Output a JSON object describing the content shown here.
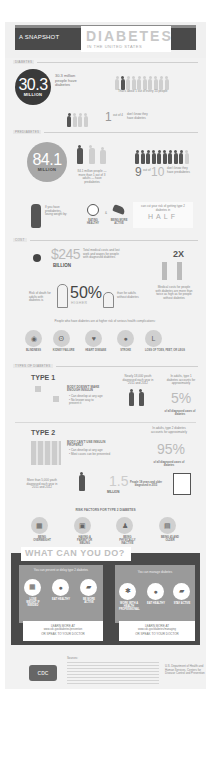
{
  "header": {
    "kicker": "A SNAPSHOT",
    "title": "DIABETES",
    "subtitle": "IN THE UNITED STATES"
  },
  "diabetes": {
    "section_label": "DIABETES",
    "big_number": "30.3",
    "big_unit": "MILLION",
    "stat_text": "30.3 million people have diabetes",
    "people_caption": "That's about 1 out of every 10 people",
    "unaware_number": "1",
    "unaware_ratio": "out of 4",
    "unaware_text": "don't know they have diabetes"
  },
  "prediabetes": {
    "section_label": "PREDIABETES",
    "big_number": "84.1",
    "big_unit": "MILLION",
    "stat_text": "84.1 million people — more than 1 out of 3 adults — have prediabetes",
    "ratio_big": "9",
    "ratio_of": "out of",
    "ratio_total": "10",
    "ratio_text": "don't know they have prediabetes",
    "weight_text": "If you have prediabetes, losing weight by:",
    "action_eat": "EATING HEALTHY",
    "action_or": "&",
    "action_active": "BEING MORE ACTIVE",
    "cut_text": "can cut your risk of getting type 2 diabetes in",
    "cut_word": "HALF"
  },
  "cost": {
    "section_label": "COST",
    "dollar_amount": "$245",
    "dollar_unit": "BILLION",
    "dollar_text": "Total medical costs and lost work and wages for people with diagnosed diabetes",
    "multiplier": "2X",
    "medical_text": "Medical costs for people with diabetes are more than twice as high as for people without diabetes",
    "death_text_left": "Risk of death for adults with diabetes is",
    "death_pct": "50%",
    "death_higher": "HIGHER",
    "death_text_right": "than for adults without diabetes",
    "complications_intro": "People who have diabetes are at higher risk of serious health complications:",
    "complications": [
      {
        "icon": "eye-icon",
        "label": "BLINDNESS"
      },
      {
        "icon": "kidney-icon",
        "label": "KIDNEY FAILURE"
      },
      {
        "icon": "heart-icon",
        "label": "HEART DISEASE"
      },
      {
        "icon": "brain-icon",
        "label": "STROKE"
      },
      {
        "icon": "foot-icon",
        "label": "LOSS OF TOES, FEET, OR LEGS"
      }
    ]
  },
  "types": {
    "section_label": "TYPES OF DIABETES",
    "type1": {
      "title": "TYPE 1",
      "headline": "BODY DOESN'T MAKE ENOUGH INSULIN",
      "bullets": [
        "Can develop at any age",
        "No known way to prevent it"
      ],
      "youth_text": "Nearly 18,000 youth diagnosed each year in 2011 and 2012",
      "share_intro": "In adults, type 1 diabetes accounts for approximately",
      "share_pct": "5%",
      "share_caption": "of all diagnosed cases of diabetes"
    },
    "type2": {
      "title": "TYPE 2",
      "headline": "BODY CAN'T USE INSULIN PROPERLY",
      "bullets": [
        "Can develop at any age",
        "Most cases can be prevented"
      ],
      "share_intro": "In adults, type 2 diabetes accounts for approximately",
      "share_pct": "95%",
      "share_caption": "of all diagnosed cases of diabetes",
      "youth_text": "More than 5,000 youth diagnosed each year in 2011 and 2012",
      "adults_number": "1.5",
      "adults_unit": "MILLION",
      "adults_text": "People 18 years and older diagnosed in 2015"
    }
  },
  "risk": {
    "title": "RISK FACTORS FOR TYPE 2 DIABETES",
    "factors": [
      {
        "icon": "scale-icon",
        "label": "BEING OVERWEIGHT"
      },
      {
        "icon": "family-photo-icon",
        "label": "HAVING A PARENT OR SIBLING"
      },
      {
        "icon": "couch-icon",
        "label": "BEING PHYSICALLY INACTIVE"
      },
      {
        "icon": "calendar-icon",
        "label": "BEING 45 AND OLDER"
      }
    ]
  },
  "what": {
    "title": "WHAT CAN YOU DO?",
    "left_panel": {
      "heading": "You can prevent or delay type 2 diabetes",
      "actions": [
        {
          "icon": "scale-icon",
          "label": "LOSE WEIGHT IF NEEDED"
        },
        {
          "icon": "apple-icon",
          "label": "EAT HEALTHY"
        },
        {
          "icon": "shoe-icon",
          "label": "BE MORE ACTIVE"
        }
      ],
      "learn_title": "LEARN MORE AT",
      "learn_url": "www.cdc.gov/diabetes/prevention",
      "learn_alt": "OR SPEAK TO YOUR DOCTOR"
    },
    "right_panel": {
      "heading": "You can manage diabetes",
      "actions": [
        {
          "icon": "caduceus-icon",
          "label": "WORK WITH A HEALTH PROFESSIONAL"
        },
        {
          "icon": "apple-icon",
          "label": "EAT HEALTHY"
        },
        {
          "icon": "shoe-icon",
          "label": "STAY ACTIVE"
        }
      ],
      "learn_title": "LEARN MORE AT",
      "learn_url": "www.cdc.gov/diabetes/managing",
      "learn_alt": "OR SPEAK TO YOUR DOCTOR"
    }
  },
  "footer": {
    "logo_text": "CDC",
    "sources_label": "Sources:",
    "agency_text": "U.S. Department of Health and Human Services, Centers for Disease Control and Prevention"
  }
}
